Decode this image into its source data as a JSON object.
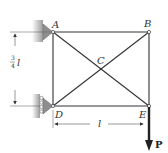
{
  "diagram": {
    "type": "truss",
    "nodes": [
      {
        "id": "A",
        "label": "A",
        "x": 53,
        "y": 32
      },
      {
        "id": "B",
        "label": "B",
        "x": 149,
        "y": 32
      },
      {
        "id": "C",
        "label": "C",
        "x": 101,
        "y": 69
      },
      {
        "id": "D",
        "label": "D",
        "x": 53,
        "y": 106
      },
      {
        "id": "E",
        "label": "E",
        "x": 149,
        "y": 106
      }
    ],
    "members": [
      [
        "A",
        "B"
      ],
      [
        "A",
        "D"
      ],
      [
        "B",
        "E"
      ],
      [
        "D",
        "E"
      ],
      [
        "A",
        "C"
      ],
      [
        "C",
        "E"
      ],
      [
        "B",
        "C"
      ],
      [
        "C",
        "D"
      ]
    ],
    "supports": {
      "A": "pin-wall",
      "D": "roller-wall"
    },
    "load": {
      "node": "E",
      "label": "P",
      "direction": "down"
    },
    "dimensions": {
      "vertical": {
        "numerator": "3",
        "denominator": "4",
        "symbol": "l"
      },
      "horizontal": {
        "symbol": "l"
      }
    },
    "colors": {
      "line": "#333333",
      "support": "#9a9a9a",
      "wall": "#b5b5b5",
      "load": "#222222"
    }
  }
}
